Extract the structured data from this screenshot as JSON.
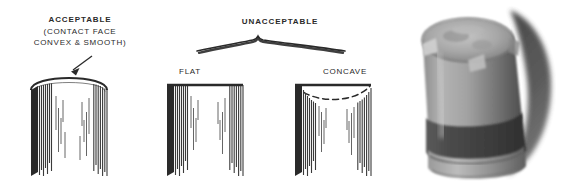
{
  "figure": {
    "background_color": "#ffffff",
    "ink_color": "#2a2a2a"
  },
  "labels": {
    "acceptable_title": "ACCEPTABLE",
    "acceptable_sub_line1": "(CONTACT FACE",
    "acceptable_sub_line2": "CONVEX & SMOOTH)",
    "unacceptable_title": "UNACCEPTABLE",
    "flat": "FLAT",
    "concave": "CONCAVE"
  },
  "diagrams": [
    {
      "name": "convex-contact-face",
      "label": "ACCEPTABLE",
      "top_profile": "convex",
      "annotation": "arrow pointing to convex contact face",
      "striations": "vertical ragged striations on both walls"
    },
    {
      "name": "flat-contact-face",
      "label": "FLAT",
      "top_profile": "flat",
      "annotation": "none",
      "striations": "vertical ragged striations on both walls"
    },
    {
      "name": "concave-contact-face",
      "label": "CONCAVE",
      "top_profile": "concave",
      "annotation": "dashed curve showing concave dip",
      "striations": "vertical ragged striations on both walls"
    }
  ],
  "brace": {
    "name": "unacceptable-brace",
    "spans": [
      "FLAT",
      "CONCAVE"
    ]
  },
  "photo": {
    "name": "contact-face-photograph",
    "subject": "cylindrical metal anvil with convex contact face",
    "tone": "grayscale",
    "colors": {
      "highlight": "#c9c9c9",
      "midtone": "#8f8f8f",
      "shadow": "#4a4a4a",
      "deep_shadow": "#343434"
    }
  }
}
